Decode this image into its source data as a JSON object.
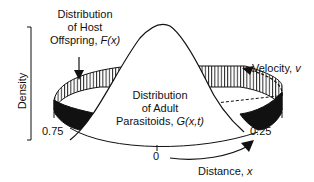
{
  "figure": {
    "y_axis_label": "Density",
    "host_label": {
      "line1": "Distribution",
      "line2": "of Host",
      "line3_prefix": "Offspring, ",
      "line3_func": "F(x)"
    },
    "parasitoid_label": {
      "line1": "Distribution",
      "line2": "of Adult",
      "line3_prefix": "Parasitoids, ",
      "line3_func": "G(x,t)"
    },
    "velocity_label": {
      "prefix": "Velocity, ",
      "symbol": "v"
    },
    "distance_label": {
      "prefix": "Distance, ",
      "symbol": "x"
    },
    "ring_ticks": [
      "0.75",
      "0",
      "0.25"
    ]
  }
}
